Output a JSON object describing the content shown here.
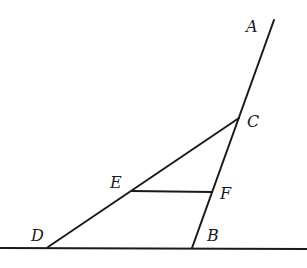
{
  "diagram": {
    "type": "geometry",
    "points": {
      "A": {
        "label": "A",
        "x": 274,
        "y": 20,
        "label_x": 246,
        "label_y": 32
      },
      "C": {
        "label": "C",
        "x": 239,
        "y": 118,
        "label_x": 247,
        "label_y": 127
      },
      "F": {
        "label": "F",
        "x": 212,
        "y": 192,
        "label_x": 220,
        "label_y": 199
      },
      "B": {
        "label": "B",
        "x": 192,
        "y": 248,
        "label_x": 207,
        "label_y": 241
      },
      "E": {
        "label": "E",
        "x": 132,
        "y": 191,
        "label_x": 110,
        "label_y": 188
      },
      "D": {
        "label": "D",
        "x": 48,
        "y": 247,
        "label_x": 31,
        "label_y": 241
      }
    },
    "segments": [
      {
        "name": "line-AB",
        "from": "A",
        "to": "B"
      },
      {
        "name": "segment-CD",
        "from": "C",
        "to": "D"
      },
      {
        "name": "segment-EF",
        "from": "E",
        "to": "F"
      }
    ],
    "baseline": {
      "name": "ground-line",
      "x1": 0,
      "y1": 248,
      "x2": 307,
      "y2": 249
    },
    "labels": [
      "A",
      "C",
      "E",
      "F",
      "D",
      "B"
    ]
  }
}
